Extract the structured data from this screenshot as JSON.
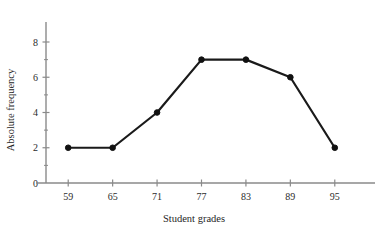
{
  "chart_data": {
    "type": "line",
    "title": "",
    "xlabel": "Student grades",
    "ylabel": "Absolute frequency",
    "x": [
      59,
      65,
      71,
      77,
      83,
      89,
      95
    ],
    "values": [
      2,
      2,
      4,
      7,
      7,
      6,
      2
    ],
    "xticks": [
      "59",
      "65",
      "71",
      "77",
      "83",
      "89",
      "95"
    ],
    "yticks": [
      "0",
      "2",
      "4",
      "6",
      "8"
    ],
    "ytick_values": [
      0,
      2,
      4,
      6,
      8
    ],
    "xlim": [
      56,
      98
    ],
    "ylim": [
      0,
      9.2
    ],
    "grid": false,
    "legend": null,
    "marker": "circle",
    "colors": {
      "line": "#1a1a1a",
      "marker": "#111111",
      "axis": "#8a8a8a",
      "text": "#2b2b2b",
      "background": "#ffffff"
    }
  }
}
